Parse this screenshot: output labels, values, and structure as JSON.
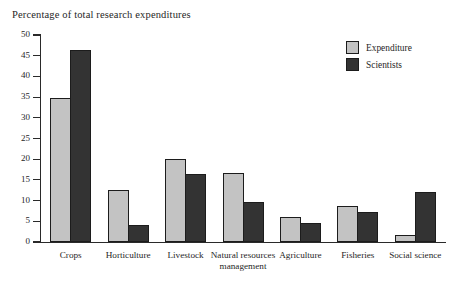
{
  "chart_data": {
    "type": "bar",
    "title": "Percentage of total research expenditures",
    "xlabel": "",
    "ylabel": "",
    "ylim": [
      0,
      50
    ],
    "ytick_step": 5,
    "yticks": [
      "0",
      "5",
      "10",
      "15",
      "20",
      "25",
      "30",
      "35",
      "40",
      "45",
      "50"
    ],
    "grid": false,
    "legend_position": "top-right",
    "categories": [
      "Crops",
      "Horticulture",
      "Livestock",
      "Natural\nresources\nmanagement",
      "Agriculture",
      "Fisheries",
      "Social\nscience"
    ],
    "series": [
      {
        "name": "Expenditure",
        "color": "#c3c3c3",
        "values": [
          34.7,
          12.5,
          20.0,
          16.6,
          6.0,
          8.6,
          1.8
        ]
      },
      {
        "name": "Scientists",
        "color": "#333333",
        "values": [
          46.3,
          4.2,
          16.5,
          9.6,
          4.5,
          7.2,
          12.2
        ]
      }
    ]
  },
  "legend": {
    "items": [
      {
        "label": "Expenditure",
        "swatch": "light"
      },
      {
        "label": "Scientists",
        "swatch": "dark"
      }
    ]
  },
  "category_labels": [
    "Crops",
    "Horticulture",
    "Livestock",
    "Natural resources management",
    "Agriculture",
    "Fisheries",
    "Social science"
  ]
}
